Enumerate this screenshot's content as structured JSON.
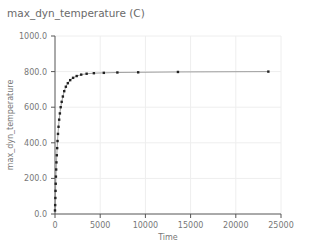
{
  "chart_data": {
    "type": "line",
    "title": "max_dyn_temperature (C)",
    "xlabel": "Time",
    "ylabel": "max_dyn_temperature",
    "xlim": [
      0,
      25000
    ],
    "ylim": [
      0,
      1000
    ],
    "x_ticks": [
      "0",
      "5000",
      "10000",
      "15000",
      "20000",
      "25000"
    ],
    "y_ticks": [
      "0.0",
      "200.0",
      "400.0",
      "600.0",
      "800.0",
      "1000.0"
    ],
    "grid": true,
    "legend": null,
    "series": [
      {
        "name": "max_dyn_temperature",
        "markers": true,
        "x": [
          0,
          20,
          40,
          60,
          80,
          100,
          130,
          160,
          200,
          240,
          280,
          330,
          390,
          460,
          540,
          630,
          740,
          870,
          1020,
          1200,
          1420,
          1680,
          2000,
          2400,
          2900,
          3500,
          4300,
          5400,
          6900,
          9200,
          13600,
          23600
        ],
        "y": [
          20,
          50,
          90,
          130,
          170,
          210,
          250,
          290,
          330,
          370,
          410,
          450,
          490,
          530,
          565,
          600,
          630,
          660,
          690,
          715,
          735,
          752,
          765,
          775,
          783,
          788,
          791,
          793,
          795,
          796,
          798,
          800
        ]
      }
    ]
  },
  "axis_colors": {
    "axis": "#555555",
    "grid": "#eeeeee",
    "line": "#888888",
    "marker": "#222222"
  }
}
